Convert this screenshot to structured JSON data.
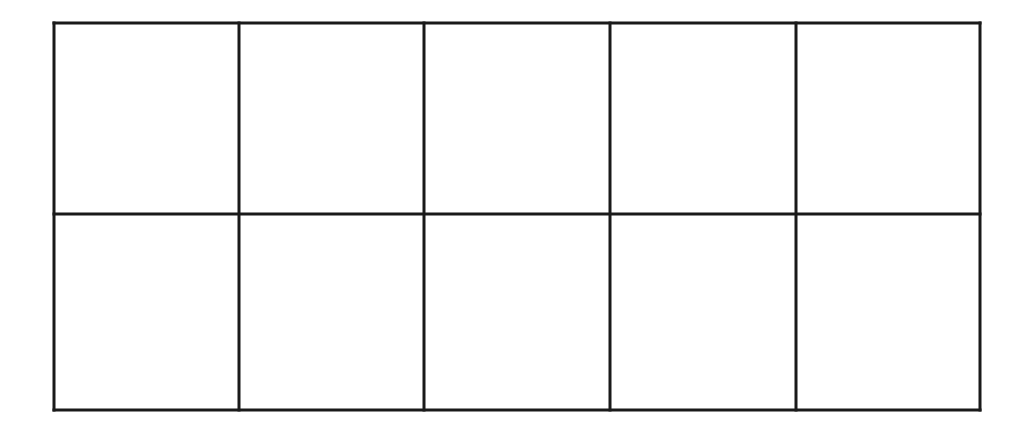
{
  "grid": {
    "rows": 2,
    "cols": 5,
    "left": 54,
    "top": 23,
    "right": 980,
    "bottom": 410,
    "col_lines": [
      54,
      239,
      424,
      610,
      796,
      980
    ],
    "row_lines": [
      23,
      214,
      410
    ],
    "stroke_color": "#1a1a1a",
    "stroke_width": 3,
    "cells": [
      [
        "",
        "",
        "",
        "",
        ""
      ],
      [
        "",
        "",
        "",
        "",
        ""
      ]
    ]
  }
}
